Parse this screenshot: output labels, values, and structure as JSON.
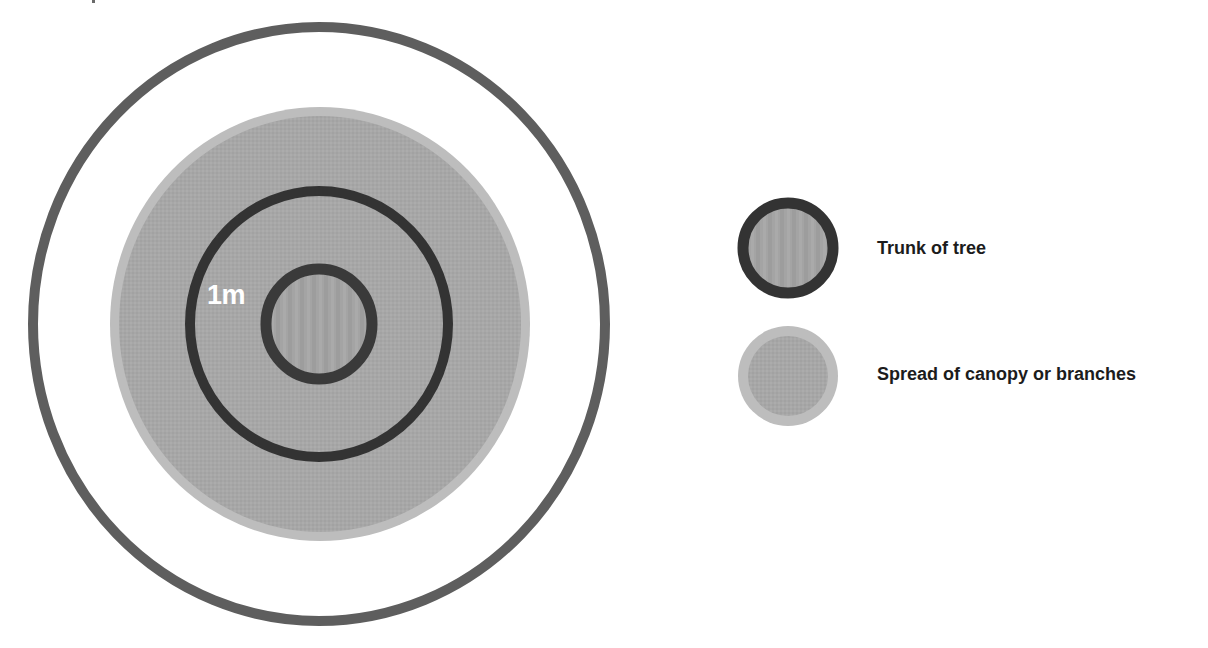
{
  "diagram": {
    "type": "tree root protection zone diagram",
    "center_label": "1m",
    "colors": {
      "background": "#ffffff",
      "outer_ring": "#5e5e5e",
      "canopy_fill": "#a7a7a7",
      "canopy_edge": "#bdbdbd",
      "ring_dark": "#333333",
      "trunk_fill": "#a3a3a3",
      "center_label": "#ffffff",
      "legend_text": "#1c1c1c"
    },
    "shapes": {
      "outer_ring": {
        "cx": 319,
        "cy": 324,
        "rx": 286,
        "ry": 297,
        "stroke_width": 10
      },
      "canopy": {
        "cx": 320,
        "cy": 324,
        "rx": 210,
        "ry": 217,
        "edge_width": 9
      },
      "one_metre_ring": {
        "cx": 319,
        "cy": 324,
        "rx": 129,
        "ry": 133,
        "stroke_width": 10
      },
      "trunk": {
        "cx": 319,
        "cy": 324,
        "rx": 53,
        "ry": 55,
        "stroke_width": 11
      }
    }
  },
  "legend": {
    "items": [
      {
        "id": "trunk",
        "label": "Trunk of tree",
        "icon": "trunk-circle-icon"
      },
      {
        "id": "canopy",
        "label": "Spread of canopy or branches",
        "icon": "canopy-circle-icon"
      }
    ]
  }
}
